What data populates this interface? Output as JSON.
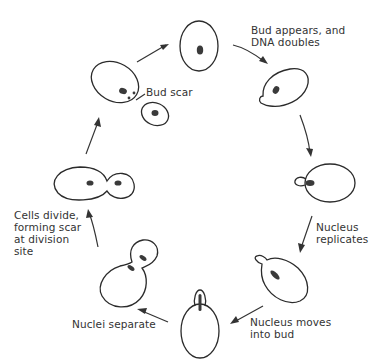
{
  "diagram": {
    "labels": {
      "bud_appears": "Bud appears, and\nDNA doubles",
      "nucleus_replicates": "Nucleus\nreplicates",
      "nucleus_moves": "Nucleus moves\ninto bud",
      "nuclei_separate": "Nuclei separate",
      "cells_divide": "Cells divide,\nforming scar\nat division\nsite",
      "bud_scar": "Bud scar"
    },
    "stages": [
      {
        "id": "mother-cell",
        "description": "single oval cell with one nucleus"
      },
      {
        "id": "bud-appears",
        "description": "cell with small bud"
      },
      {
        "id": "nucleus-replicates",
        "description": "cell with growing bud"
      },
      {
        "id": "nucleus-moves",
        "description": "elongated nucleus entering bud"
      },
      {
        "id": "nucleus-in-bud",
        "description": "nucleus stretched into bud"
      },
      {
        "id": "nuclei-separate",
        "description": "two nuclei in mother and bud"
      },
      {
        "id": "cells-divide",
        "description": "mother and daughter joined"
      },
      {
        "id": "separated-cells",
        "description": "mother with bud scar and daughter cell"
      }
    ],
    "colors": {
      "stroke": "#2b2b2b",
      "nucleus": "#3a3a3a",
      "background": "#ffffff"
    }
  }
}
